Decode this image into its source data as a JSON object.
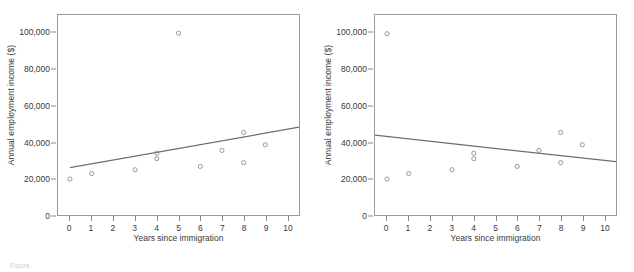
{
  "figure": {
    "caption": "Figure.",
    "point_color": "#8c8c8c",
    "line_color": "#6e6e6e",
    "axis_color": "#9b9b9b"
  },
  "chart_data": [
    {
      "type": "scatter",
      "title": "",
      "panel": "left",
      "xlabel": "Years since immigration",
      "ylabel": "Annual employment income ($)",
      "xlim": [
        -0.55,
        10.55
      ],
      "ylim": [
        0,
        110000
      ],
      "grid": false,
      "legend": null,
      "xticks": [
        0,
        1,
        2,
        3,
        4,
        5,
        6,
        7,
        8,
        9,
        10
      ],
      "xticklabels": [
        "0",
        "1",
        "2",
        "3",
        "4",
        "5",
        "6",
        "7",
        "8",
        "9",
        "10"
      ],
      "yticks": [
        0,
        20000,
        40000,
        60000,
        80000,
        100000
      ],
      "yticklabels": [
        "0",
        "20,000",
        "40,000",
        "60,000",
        "80,000",
        "100,000"
      ],
      "points": [
        {
          "x": 0,
          "y": 19800
        },
        {
          "x": 1,
          "y": 22800
        },
        {
          "x": 3,
          "y": 24900
        },
        {
          "x": 4,
          "y": 34000
        },
        {
          "x": 4,
          "y": 31000
        },
        {
          "x": 5,
          "y": 100000
        },
        {
          "x": 6,
          "y": 26700
        },
        {
          "x": 7,
          "y": 35500
        },
        {
          "x": 8,
          "y": 45400
        },
        {
          "x": 8,
          "y": 28800
        },
        {
          "x": 9,
          "y": 38600
        }
      ],
      "trendline": {
        "x0": 0,
        "y0": 26000,
        "x1": 10.55,
        "y1": 48300
      }
    },
    {
      "type": "scatter",
      "title": "",
      "panel": "right",
      "xlabel": "Years since immigration",
      "ylabel": "Annual employment income ($)",
      "xlim": [
        -0.55,
        10.55
      ],
      "ylim": [
        0,
        110000
      ],
      "grid": false,
      "legend": null,
      "xticks": [
        0,
        1,
        2,
        3,
        4,
        5,
        6,
        7,
        8,
        9,
        10
      ],
      "xticklabels": [
        "0",
        "1",
        "2",
        "3",
        "4",
        "5",
        "6",
        "7",
        "8",
        "9",
        "10"
      ],
      "yticks": [
        0,
        20000,
        40000,
        60000,
        80000,
        100000
      ],
      "yticklabels": [
        "0",
        "20,000",
        "40,000",
        "60,000",
        "80,000",
        "100,000"
      ],
      "points": [
        {
          "x": 0,
          "y": 99700
        },
        {
          "x": 0,
          "y": 19800
        },
        {
          "x": 1,
          "y": 22800
        },
        {
          "x": 3,
          "y": 24900
        },
        {
          "x": 4,
          "y": 34000
        },
        {
          "x": 4,
          "y": 31000
        },
        {
          "x": 6,
          "y": 26700
        },
        {
          "x": 7,
          "y": 35500
        },
        {
          "x": 8,
          "y": 45400
        },
        {
          "x": 8,
          "y": 28800
        },
        {
          "x": 9,
          "y": 38600
        }
      ],
      "trendline": {
        "x0": -0.55,
        "y0": 43900,
        "x1": 10.55,
        "y1": 29300
      }
    }
  ]
}
